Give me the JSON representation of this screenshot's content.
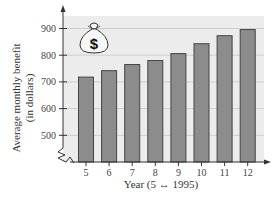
{
  "chart_data": {
    "type": "bar",
    "title": "",
    "xlabel": "Year (5 ↔ 1995)",
    "ylabel": "Average monthly benefit (in dollars)",
    "ylabel_lines": [
      "Average monthly benefit",
      "(in dollars)"
    ],
    "categories": [
      "5",
      "6",
      "7",
      "8",
      "9",
      "10",
      "11",
      "12"
    ],
    "values": [
      718,
      742,
      765,
      780,
      806,
      843,
      873,
      896
    ],
    "ylim": [
      400,
      950
    ],
    "yticks": [
      500,
      600,
      700,
      800,
      900
    ],
    "y_axis_break": true,
    "grid": true,
    "legend": null,
    "icon": "money-bag-icon",
    "icon_symbol": "$",
    "colors": {
      "bar_fill": "#8c8c8c",
      "bar_stroke": "#444444",
      "panel_bg": "#ececec",
      "grid": "#cfcfcf",
      "axis": "#333333"
    }
  }
}
